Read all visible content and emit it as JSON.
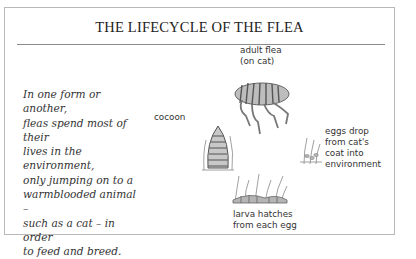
{
  "title": "THE LIFECYCLE OF THE FLEA",
  "intro_text": "In one form or another, fleas spend most of their lives in the environment, only jumping on to a warmblooded animal – such as a cat – in order to feed and breed.",
  "intro_lines": [
    "In one form or another,",
    "fleas spend most of their",
    "lives in the environment,",
    "only jumping on to a",
    "warmblooded animal –",
    "such as a cat – in order",
    "to feed and breed."
  ],
  "stages": {
    "adult": {
      "line1": "adult flea",
      "line2": "(on cat)",
      "icon": "adult-flea-icon"
    },
    "eggs": {
      "line1": "eggs drop",
      "line2": "from cat's",
      "line3": "coat into",
      "line4": "environment",
      "icon": "flea-eggs-icon"
    },
    "larva": {
      "line1": "larva hatches",
      "line2": "from each egg",
      "icon": "flea-larva-icon"
    },
    "cocoon": {
      "line1": "cocoon",
      "icon": "flea-cocoon-icon"
    }
  }
}
